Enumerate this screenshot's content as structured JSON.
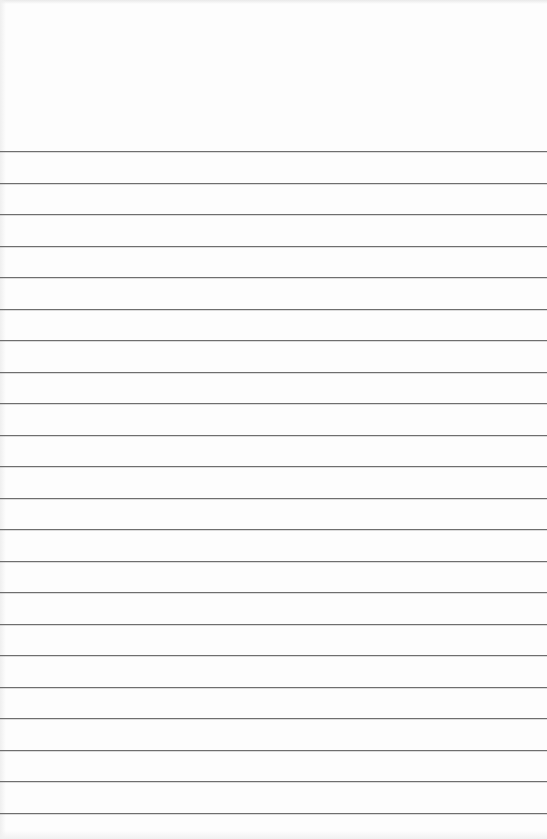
{
  "page": {
    "type": "ruled-paper",
    "background_color": "#fdfdfd",
    "rule_color": "#6e6e6e",
    "first_rule_y": 151,
    "rule_spacing": 31.5,
    "rule_count": 22
  }
}
